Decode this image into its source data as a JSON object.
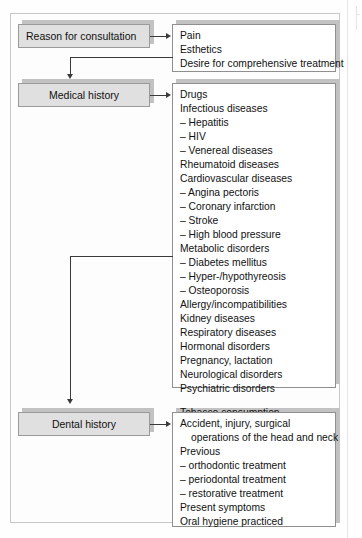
{
  "diagram": {
    "type": "flowchart",
    "stages": [
      {
        "id": "reason-for-consultation",
        "label": "Reason for consultation",
        "items": [
          "Pain",
          "Esthetics",
          "Desire for comprehensive treatment"
        ]
      },
      {
        "id": "medical-history",
        "label": "Medical history",
        "items": [
          "Drugs",
          "Infectious diseases",
          "– Hepatitis",
          "– HIV",
          "– Venereal diseases",
          "Rheumatoid diseases",
          "Cardiovascular diseases",
          "– Angina pectoris",
          "– Coronary infarction",
          "– Stroke",
          "– High blood pressure",
          "Metabolic disorders",
          "– Diabetes mellitus",
          "– Hyper-/hypothyreosis",
          "– Osteoporosis",
          "Allergy/incompatibilities",
          "Kidney diseases",
          "Respiratory diseases",
          "Hormonal disorders",
          "Pregnancy, lactation",
          "Neurological disorders",
          "Psychiatric disorders",
          "",
          "Tobacco consumption"
        ]
      },
      {
        "id": "dental-history",
        "label": "Dental history",
        "items": [
          "Accident, injury, surgical",
          "operations of the head and neck",
          "Previous",
          "– orthodontic treatment",
          "– periodontal treatment",
          "– restorative treatment",
          "Present symptoms",
          "Oral hygiene practiced"
        ],
        "wrapped_line_indices": [
          1
        ]
      }
    ],
    "colors": {
      "label_fill": "#e0e0e0",
      "label_border": "#9a9a9a",
      "shadow": "#c2c2c2",
      "list_border": "#8f8f8f",
      "connector": "#3a3a3a",
      "text": "#111111",
      "page_background": "#fefefe"
    }
  }
}
